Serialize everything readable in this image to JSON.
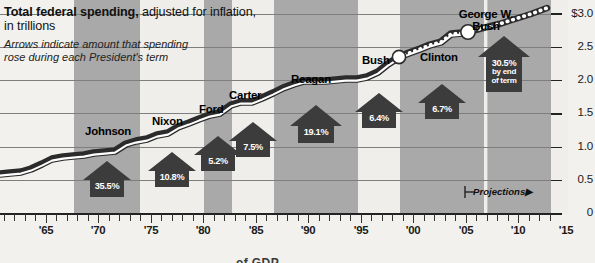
{
  "header": {
    "title_bold": "Total federal spending,",
    "title_rest": " adjusted for inflation,",
    "title_line2": "in trillions",
    "subtitle_line1": "Arrows indicate amount that spending",
    "subtitle_line2": "rose during each President's term"
  },
  "annotations": {
    "projections_label": "Projections",
    "projections_arrow": "▶",
    "cutoff_text": "of GDP"
  },
  "colors": {
    "background": "#f2f1ed",
    "band_shaded": "#a9a9a9",
    "band_light": "#efeeea",
    "line_dark": "#2b2b2b",
    "line_core": "#ffffff",
    "arrow_fill": "#3c3c3c",
    "grid": "#8c8c8c",
    "text": "#111111"
  },
  "chart_data": {
    "type": "line",
    "title": "Total federal spending, adjusted for inflation, in trillions",
    "xlabel": "",
    "ylabel": "",
    "xlim": [
      1963,
      2015
    ],
    "ylim": [
      0,
      3.15
    ],
    "yticks": [
      0,
      0.5,
      1.0,
      1.5,
      2.0,
      2.5,
      3.0
    ],
    "ytick_labels": [
      "0",
      "0.5",
      "1.0",
      "1.5",
      "2.0",
      "2.5",
      "3.0"
    ],
    "ytop_label": "$3.0",
    "xticks": [
      1965,
      1970,
      1975,
      1980,
      1985,
      1990,
      1995,
      2000,
      2005,
      2010,
      2015
    ],
    "xtick_labels": [
      "'65",
      "'70",
      "'75",
      "'80",
      "'85",
      "'90",
      "'95",
      "'00",
      "'05",
      "'10",
      "'15"
    ],
    "grid": "horizontal",
    "legend": "none",
    "series": [
      {
        "name": "Total federal spending (actual)",
        "style": "solid-thick",
        "x": [
          1963,
          1964,
          1965,
          1966,
          1967,
          1968,
          1969,
          1970,
          1971,
          1972,
          1973,
          1974,
          1975,
          1976,
          1977,
          1978,
          1979,
          1980,
          1981,
          1982,
          1983,
          1984,
          1985,
          1986,
          1987,
          1988,
          1989,
          1990,
          1991,
          1992,
          1993,
          1994,
          1995,
          1996,
          1997,
          1998,
          1999,
          2000,
          2001,
          2002,
          2003,
          2004,
          2005,
          2006,
          2007,
          2008,
          2009,
          2010
        ],
        "y": [
          0.6,
          0.62,
          0.63,
          0.68,
          0.76,
          0.83,
          0.86,
          0.88,
          0.89,
          0.93,
          0.94,
          0.96,
          1.05,
          1.09,
          1.13,
          1.19,
          1.22,
          1.31,
          1.38,
          1.44,
          1.52,
          1.55,
          1.67,
          1.71,
          1.72,
          1.77,
          1.83,
          1.91,
          1.97,
          2.01,
          2.0,
          2.01,
          2.03,
          2.03,
          2.05,
          2.05,
          2.07,
          2.1,
          2.17,
          2.3,
          2.4,
          2.47,
          2.54,
          2.6,
          2.64,
          2.76,
          2.95,
          2.97
        ]
      },
      {
        "name": "Projections",
        "style": "dotted-beaded",
        "x": [
          2010,
          2011,
          2012,
          2013,
          2014,
          2015
        ],
        "y": [
          2.97,
          2.99,
          3.01,
          3.04,
          3.09,
          3.15
        ]
      }
    ],
    "markers": [
      {
        "label": "",
        "x": 2001,
        "y": 2.05,
        "shape": "circle-white"
      },
      {
        "label": "",
        "x": 2009,
        "y": 2.78,
        "shape": "circle-white"
      }
    ],
    "president_terms": [
      {
        "name": "Johnson",
        "start": 1964,
        "end": 1969,
        "increase": "35.5%",
        "shaded": true
      },
      {
        "name": "Nixon",
        "start": 1969,
        "end": 1975,
        "increase": "10.8%",
        "shaded": false
      },
      {
        "name": "Ford",
        "start": 1975,
        "end": 1977,
        "increase": "5.2%",
        "shaded": true
      },
      {
        "name": "Carter",
        "start": 1977,
        "end": 1981,
        "increase": "7.5%",
        "shaded": false
      },
      {
        "name": "Reagan",
        "start": 1981,
        "end": 1989,
        "increase": "19.1%",
        "shaded": true
      },
      {
        "name": "Bush",
        "start": 1989,
        "end": 1993,
        "increase": "6.4%",
        "shaded": false
      },
      {
        "name": "Clinton",
        "start": 1993,
        "end": 2001,
        "increase": "6.7%",
        "shaded": true
      },
      {
        "name": "George W. Bush",
        "start": 2001,
        "end": 2009,
        "increase": "30.5%",
        "increase_note1": "by end",
        "increase_note2": "of term",
        "shaded": false
      },
      {
        "name": "",
        "start": 2009,
        "end": 2015,
        "increase": "",
        "shaded": true
      }
    ]
  }
}
